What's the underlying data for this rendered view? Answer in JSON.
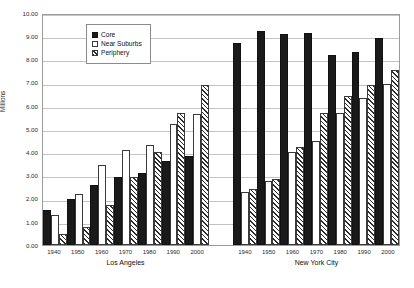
{
  "chart_data": {
    "type": "bar",
    "title": "",
    "xlabel": "",
    "ylabel": "Millions",
    "ylim": [
      0,
      10
    ],
    "ytick_step": 1,
    "grid": true,
    "legend_position": "upper-left-inside",
    "categories": [
      "1940",
      "1950",
      "1960",
      "1970",
      "1980",
      "1990",
      "2000"
    ],
    "groups": [
      {
        "name": "Los Angeles",
        "series": [
          {
            "name": "Core",
            "values": [
              1.5,
              1.97,
              2.58,
              2.95,
              3.12,
              3.63,
              3.84
            ]
          },
          {
            "name": "Near Suburbs",
            "values": [
              1.28,
              2.2,
              3.43,
              4.08,
              4.33,
              5.22,
              5.63
            ]
          },
          {
            "name": "Periphery",
            "values": [
              0.47,
              0.79,
              1.72,
              2.93,
              4.02,
              5.67,
              6.88
            ]
          }
        ]
      },
      {
        "name": "New York City",
        "series": [
          {
            "name": "Core",
            "values": [
              8.7,
              9.22,
              9.08,
              9.13,
              8.17,
              8.32,
              8.93
            ]
          },
          {
            "name": "Near Suburbs",
            "values": [
              2.3,
              2.78,
              4.0,
              4.48,
              5.68,
              6.32,
              6.92
            ]
          },
          {
            "name": "Periphery",
            "values": [
              2.43,
              2.85,
              4.22,
              5.68,
              6.42,
              6.88,
              7.53
            ]
          }
        ]
      }
    ],
    "ytick_labels": [
      "0.00",
      "1.00",
      "2.00",
      "3.00",
      "4.00",
      "5.00",
      "6.00",
      "7.00",
      "8.00",
      "9.00",
      "10.00"
    ],
    "legend_entries": [
      {
        "label": "Core",
        "style": "solid-black"
      },
      {
        "label": "Near Suburbs",
        "style": "white-outline"
      },
      {
        "label": "Periphery",
        "style": "diagonal-hatch"
      }
    ],
    "colors": {
      "core": "#1a1a1a",
      "near_suburbs": "#ffffff",
      "periphery_hatch": "#2b2b2b",
      "gridline": "#c4c4c4",
      "axis": "#9a9a9a",
      "text": "#2a2a2a"
    }
  }
}
